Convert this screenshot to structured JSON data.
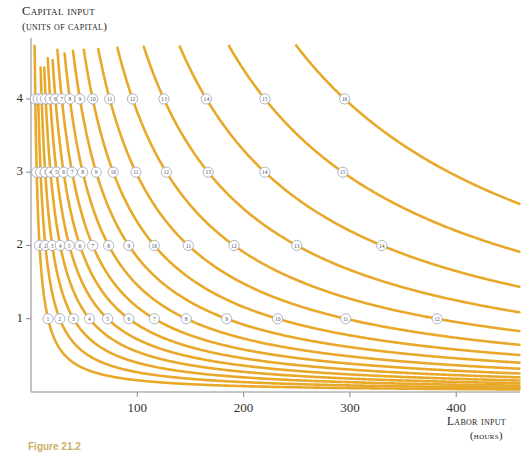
{
  "figure": {
    "caption": "Figure 21.2"
  },
  "axes": {
    "y_title_line1": "Capital input",
    "y_title_line2": "(units of capital)",
    "x_title_line1": "Labor input",
    "x_title_line2": "(hours)",
    "y_ticks": [
      "1",
      "2",
      "3",
      "4"
    ],
    "x_ticks": [
      "100",
      "200",
      "300",
      "400"
    ]
  },
  "colors": {
    "curve": "#E8A92B",
    "axis": "#8c9098",
    "label_ring": "#9aa3b0",
    "label_text": "#4a5568",
    "background": "#ffffff"
  },
  "chart_data": {
    "type": "line",
    "title": "",
    "xlabel": "Labor input (hours)",
    "ylabel": "Capital input (units of capital)",
    "xlim": [
      0,
      460
    ],
    "ylim": [
      0,
      4.75
    ],
    "grid": false,
    "legend": "none",
    "series": [
      {
        "name": "1",
        "label": "1",
        "constant": 16
      },
      {
        "name": "2",
        "label": "2",
        "constant": 27
      },
      {
        "name": "3",
        "label": "3",
        "constant": 40
      },
      {
        "name": "4",
        "label": "4",
        "constant": 55
      },
      {
        "name": "5",
        "label": "5",
        "constant": 72
      },
      {
        "name": "6",
        "label": "6",
        "constant": 92
      },
      {
        "name": "7",
        "label": "7",
        "constant": 116
      },
      {
        "name": "8",
        "label": "8",
        "constant": 146
      },
      {
        "name": "9",
        "label": "9",
        "constant": 184
      },
      {
        "name": "10",
        "label": "10",
        "constant": 232
      },
      {
        "name": "11",
        "label": "11",
        "constant": 296
      },
      {
        "name": "12",
        "label": "12",
        "constant": 382
      },
      {
        "name": "13",
        "label": "13",
        "constant": 500
      },
      {
        "name": "14",
        "label": "14",
        "constant": 660
      },
      {
        "name": "15",
        "label": "15",
        "constant": 880
      },
      {
        "name": "16",
        "label": "16",
        "constant": 1180
      }
    ],
    "curve_labels": [
      {
        "text": "1",
        "capital_level": 1
      },
      {
        "text": "2",
        "capital_level": 1
      },
      {
        "text": "3",
        "capital_level": 1
      },
      {
        "text": "4",
        "capital_level": 1
      },
      {
        "text": "5",
        "capital_level": 1
      },
      {
        "text": "6",
        "capital_level": 1
      },
      {
        "text": "7",
        "capital_level": 1
      },
      {
        "text": "8",
        "capital_level": 1
      },
      {
        "text": "9",
        "capital_level": 1
      },
      {
        "text": "10",
        "capital_level": 1
      },
      {
        "text": "11",
        "capital_level": 1
      },
      {
        "text": "12",
        "capital_level": 1
      },
      {
        "text": "13",
        "capital_level": 1
      },
      {
        "text": "1",
        "capital_level": 2
      },
      {
        "text": "2",
        "capital_level": 2
      },
      {
        "text": "3",
        "capital_level": 2
      },
      {
        "text": "4",
        "capital_level": 2
      },
      {
        "text": "5",
        "capital_level": 2
      },
      {
        "text": "6",
        "capital_level": 2
      },
      {
        "text": "7",
        "capital_level": 2
      },
      {
        "text": "8",
        "capital_level": 2
      },
      {
        "text": "9",
        "capital_level": 2
      },
      {
        "text": "10",
        "capital_level": 2
      },
      {
        "text": "11",
        "capital_level": 2
      },
      {
        "text": "12",
        "capital_level": 2
      },
      {
        "text": "13",
        "capital_level": 2
      },
      {
        "text": "14",
        "capital_level": 2
      },
      {
        "text": "1",
        "capital_level": 3
      },
      {
        "text": "2",
        "capital_level": 3
      },
      {
        "text": "3",
        "capital_level": 3
      },
      {
        "text": "4",
        "capital_level": 3
      },
      {
        "text": "5",
        "capital_level": 3
      },
      {
        "text": "6",
        "capital_level": 3
      },
      {
        "text": "7",
        "capital_level": 3
      },
      {
        "text": "8",
        "capital_level": 3
      },
      {
        "text": "9",
        "capital_level": 3
      },
      {
        "text": "10",
        "capital_level": 3
      },
      {
        "text": "11",
        "capital_level": 3
      },
      {
        "text": "12",
        "capital_level": 3
      },
      {
        "text": "13",
        "capital_level": 3
      },
      {
        "text": "14",
        "capital_level": 3
      },
      {
        "text": "15",
        "capital_level": 3
      },
      {
        "text": "1",
        "capital_level": 4
      },
      {
        "text": "2",
        "capital_level": 4
      },
      {
        "text": "3",
        "capital_level": 4
      },
      {
        "text": "4",
        "capital_level": 4
      },
      {
        "text": "5",
        "capital_level": 4
      },
      {
        "text": "6",
        "capital_level": 4
      },
      {
        "text": "7",
        "capital_level": 4
      },
      {
        "text": "8",
        "capital_level": 4
      },
      {
        "text": "9",
        "capital_level": 4
      },
      {
        "text": "10",
        "capital_level": 4
      },
      {
        "text": "11",
        "capital_level": 4
      },
      {
        "text": "12",
        "capital_level": 4
      },
      {
        "text": "13",
        "capital_level": 4
      },
      {
        "text": "14",
        "capital_level": 4
      },
      {
        "text": "15",
        "capital_level": 4
      },
      {
        "text": "16",
        "capital_level": 4
      }
    ]
  }
}
